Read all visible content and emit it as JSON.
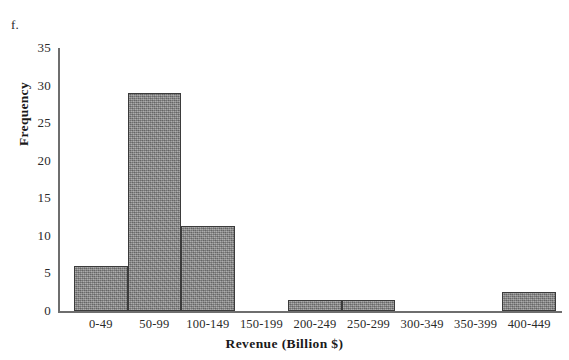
{
  "figure": {
    "part_label": "f."
  },
  "chart_data": {
    "type": "bar",
    "title": "",
    "xlabel": "Revenue (Billion $)",
    "ylabel": "Frequency",
    "categories": [
      "0-49",
      "50-99",
      "100-149",
      "150-199",
      "200-249",
      "250-299",
      "300-349",
      "350-399",
      "400-449"
    ],
    "values": [
      6,
      29,
      11.3,
      0,
      1.5,
      1.5,
      0,
      0,
      2.5
    ],
    "ylim": [
      0,
      35
    ],
    "yticks": [
      0,
      5,
      10,
      15,
      20,
      25,
      30,
      35
    ],
    "ytick_labels": [
      "0",
      "5",
      "10",
      "15",
      "20",
      "25",
      "30",
      "35"
    ],
    "grid": false,
    "legend": "none",
    "bar_fill_color": "#8a8a8a",
    "bar_edge_color": "#3b3b3b",
    "axis_color": "#6e6e6e"
  }
}
